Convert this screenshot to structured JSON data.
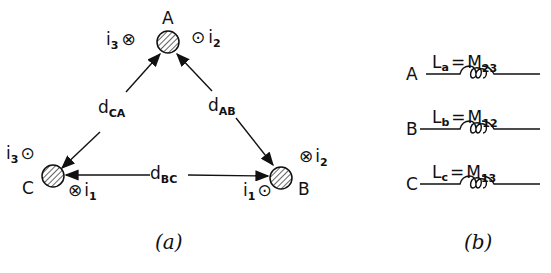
{
  "diagram_a": {
    "caption": "(a)",
    "nodes": {
      "A": {
        "label": "A",
        "left_current": "i",
        "left_sub": "3",
        "left_symbol": "⊗",
        "right_current": "i",
        "right_sub": "2",
        "right_symbol": "⊙"
      },
      "B": {
        "label": "B",
        "top_current": "i",
        "top_sub": "2",
        "top_symbol": "⊗",
        "bottom_current": "i",
        "bottom_sub": "1",
        "bottom_symbol": "⊙"
      },
      "C": {
        "label": "C",
        "top_current": "i",
        "top_sub": "3",
        "top_symbol": "⊙",
        "bottom_current": "i",
        "bottom_sub": "1",
        "bottom_symbol": "⊗"
      }
    },
    "distances": {
      "CA": {
        "main": "d",
        "sub": "CA"
      },
      "AB": {
        "main": "d",
        "sub": "AB"
      },
      "BC": {
        "main": "d",
        "sub": "BC"
      }
    }
  },
  "diagram_b": {
    "caption": "(b)",
    "inductors": [
      {
        "phase": "A",
        "L": "L",
        "L_sub": "a",
        "eq": "=",
        "M": "M",
        "M_sub": "23"
      },
      {
        "phase": "B",
        "L": "L",
        "L_sub": "b",
        "eq": "=",
        "M": "M",
        "M_sub": "12"
      },
      {
        "phase": "C",
        "L": "L",
        "L_sub": "c",
        "eq": "=",
        "M": "M",
        "M_sub": "13"
      }
    ]
  }
}
